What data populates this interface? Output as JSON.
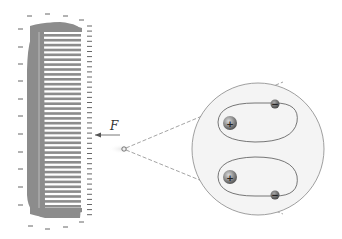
{
  "diagram": {
    "force_label": "F",
    "comb": {
      "teeth_count": 36,
      "color": "#8c8c8c",
      "charge": "negative"
    },
    "magnified_view": {
      "atoms": [
        {
          "nucleus_sign": "+",
          "electron_sign": "−"
        },
        {
          "nucleus_sign": "+",
          "electron_sign": "−"
        }
      ],
      "circle_fill": "#f4f4f4"
    }
  }
}
